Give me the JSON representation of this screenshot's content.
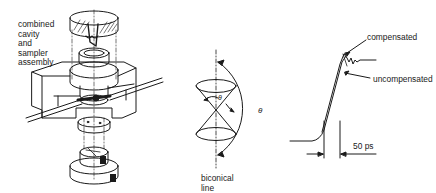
{
  "figure": {
    "panels": [
      {
        "id": "assembly",
        "label_lines": [
          "combined",
          "cavity",
          "and",
          "sampler",
          "assembly"
        ]
      },
      {
        "id": "biconical",
        "label_lines": [
          "biconical",
          "line"
        ],
        "angle_small": "θ",
        "angle_large": "θ"
      },
      {
        "id": "waveform",
        "compensated_label": "compensated",
        "uncompensated_label": "uncompensated",
        "time_marker": "50 ps"
      }
    ]
  },
  "colors": {
    "ink": "#1a1a1a",
    "background": "#ffffff"
  }
}
